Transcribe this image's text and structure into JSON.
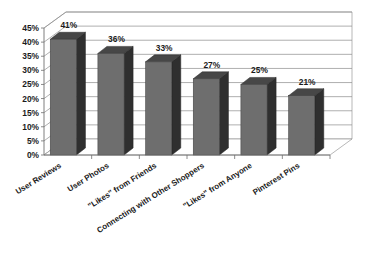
{
  "chart_data": {
    "type": "bar",
    "title": "",
    "subtitle": "",
    "xlabel": "",
    "ylabel": "",
    "categories": [
      "User Reviews",
      "User Photos",
      "\"Likes\" from Friends",
      "Connecting with Other Shoppers",
      "\"Likes\" from Anyone",
      "Pinterest Pins"
    ],
    "values": [
      41,
      36,
      33,
      27,
      25,
      21
    ],
    "value_labels": [
      "41%",
      "36%",
      "33%",
      "27%",
      "25%",
      "21%"
    ],
    "ylim": [
      0,
      45
    ],
    "ytick_values": [
      0,
      5,
      10,
      15,
      20,
      25,
      30,
      35,
      40,
      45
    ],
    "ytick_labels": [
      "0%",
      "5%",
      "10%",
      "15%",
      "20%",
      "25%",
      "30%",
      "35%",
      "40%",
      "45%"
    ],
    "grid": true,
    "legend": false,
    "legend_position": "none",
    "style": "3d-column",
    "colors": {
      "bar_front": "#6e6e6e",
      "bar_side": "#2f2f2f",
      "bar_top": "#474747",
      "gridline": "#8d8d8d",
      "axis": "#6f6f6f",
      "text": "#1b1b1b",
      "background": "#ffffff"
    }
  }
}
